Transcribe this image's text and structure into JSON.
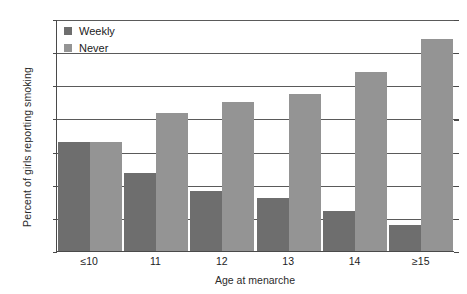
{
  "chart_data": {
    "type": "bar",
    "title": "",
    "subtitle": "",
    "xlabel": "Age at menarche",
    "ylabel": "Percent of girls reporting smoking",
    "categories": [
      "≤10",
      "11",
      "12",
      "13",
      "14",
      "≥15"
    ],
    "series": [
      {
        "name": "Weekly",
        "color": "#6e6e6e",
        "values": [
          33,
          23.5,
          18,
          16,
          12,
          8
        ]
      },
      {
        "name": "Never",
        "color": "#949494",
        "values": [
          33,
          41.5,
          45,
          47.5,
          54,
          64
        ]
      }
    ],
    "ylim": [
      0,
      70
    ],
    "ytick_values": [
      0,
      10,
      20,
      30,
      40,
      50,
      60,
      70
    ],
    "ytick_labels": [
      "0",
      "10",
      "20",
      "30",
      "40",
      "50",
      "60",
      "70"
    ],
    "grid": true,
    "grid_axis": "y",
    "legend_position": "top-left",
    "legend_entries": [
      "Weekly",
      "Never"
    ],
    "annotations": []
  }
}
